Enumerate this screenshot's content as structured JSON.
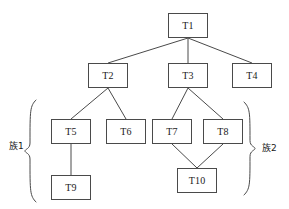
{
  "diagram": {
    "type": "tree-hierarchy",
    "width": 289,
    "height": 209,
    "background_color": "#ffffff",
    "stroke_color": "#4a4a4a",
    "text_color": "#1a1a1a",
    "nodes": [
      {
        "id": "T1",
        "label": "T1",
        "x": 168,
        "y": 13,
        "w": 40,
        "h": 25
      },
      {
        "id": "T2",
        "label": "T2",
        "x": 88,
        "y": 63,
        "w": 40,
        "h": 25
      },
      {
        "id": "T3",
        "label": "T3",
        "x": 168,
        "y": 63,
        "w": 40,
        "h": 25
      },
      {
        "id": "T4",
        "label": "T4",
        "x": 232,
        "y": 63,
        "w": 40,
        "h": 25
      },
      {
        "id": "T5",
        "label": "T5",
        "x": 51,
        "y": 119,
        "w": 40,
        "h": 25
      },
      {
        "id": "T6",
        "label": "T6",
        "x": 106,
        "y": 119,
        "w": 40,
        "h": 25
      },
      {
        "id": "T7",
        "label": "T7",
        "x": 152,
        "y": 119,
        "w": 40,
        "h": 25
      },
      {
        "id": "T8",
        "label": "T8",
        "x": 203,
        "y": 119,
        "w": 40,
        "h": 25
      },
      {
        "id": "T9",
        "label": "T9",
        "x": 51,
        "y": 175,
        "w": 40,
        "h": 25
      },
      {
        "id": "T10",
        "label": "T10",
        "x": 177,
        "y": 168,
        "w": 40,
        "h": 25
      }
    ],
    "edges": [
      {
        "from": "T1",
        "to": "T2"
      },
      {
        "from": "T1",
        "to": "T3"
      },
      {
        "from": "T1",
        "to": "T4"
      },
      {
        "from": "T2",
        "to": "T5"
      },
      {
        "from": "T2",
        "to": "T6"
      },
      {
        "from": "T3",
        "to": "T7"
      },
      {
        "from": "T3",
        "to": "T8"
      },
      {
        "from": "T5",
        "to": "T9"
      },
      {
        "from": "T7",
        "to": "T10"
      },
      {
        "from": "T8",
        "to": "T10"
      }
    ],
    "groups": [
      {
        "id": "group-1",
        "label": "族1",
        "side": "left",
        "label_x": 9,
        "label_y": 142,
        "brace_x": 30,
        "brace_top": 100,
        "brace_bottom": 202,
        "members": [
          "T5",
          "T6",
          "T9"
        ]
      },
      {
        "id": "group-2",
        "label": "族2",
        "side": "right",
        "label_x": 262,
        "label_y": 144,
        "brace_x": 250,
        "brace_top": 102,
        "brace_bottom": 195,
        "members": [
          "T7",
          "T8",
          "T10"
        ]
      }
    ]
  }
}
